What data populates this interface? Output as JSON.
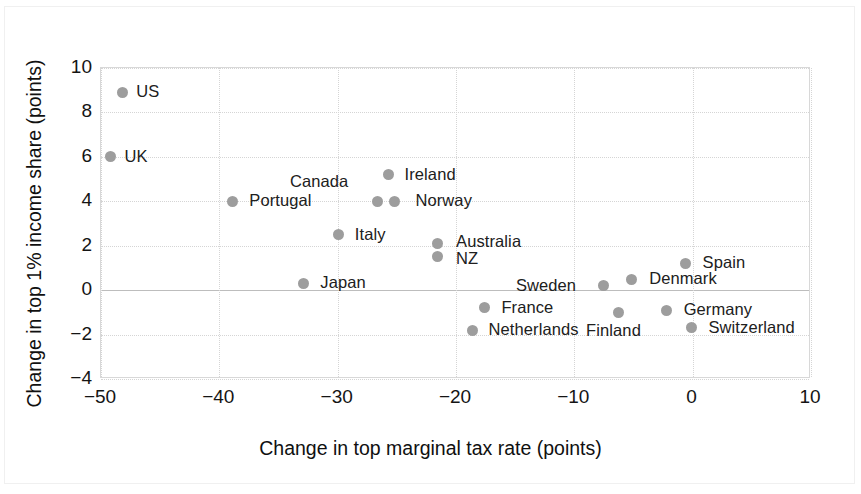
{
  "chart_data": {
    "type": "scatter",
    "title": "",
    "xlabel": "Change in top marginal tax rate (points)",
    "ylabel": "Change in top 1% income share (points)",
    "xlim": [
      -50,
      10
    ],
    "ylim": [
      -4,
      10
    ],
    "xticks": [
      "−50",
      "−40",
      "−30",
      "−20",
      "−10",
      "0",
      "10"
    ],
    "xtick_values": [
      -50,
      -40,
      -30,
      -20,
      -10,
      0,
      10
    ],
    "yticks": [
      "10",
      "8",
      "6",
      "4",
      "2",
      "0",
      "−2",
      "−4"
    ],
    "ytick_values": [
      10,
      8,
      6,
      4,
      2,
      0,
      -2,
      -4
    ],
    "grid": true,
    "legend": "none",
    "marker_color": "#9d9d9d",
    "points": [
      {
        "label": "US",
        "x": -48.2,
        "y": 8.9,
        "lx": 14,
        "ly": -10
      },
      {
        "label": "UK",
        "x": -49.2,
        "y": 6.0,
        "lx": 14,
        "ly": -10
      },
      {
        "label": "Portugal",
        "x": -38.9,
        "y": 4.0,
        "lx": 17,
        "ly": -10
      },
      {
        "label": "Canada",
        "x": -26.6,
        "y": 4.0,
        "lx": -88,
        "ly": -29
      },
      {
        "label": "Ireland",
        "x": -25.7,
        "y": 5.2,
        "lx": 16,
        "ly": -10
      },
      {
        "label": "Norway",
        "x": -25.2,
        "y": 4.0,
        "lx": 21,
        "ly": -10
      },
      {
        "label": "Italy",
        "x": -29.9,
        "y": 2.5,
        "lx": 16,
        "ly": -10
      },
      {
        "label": "Australia",
        "x": -21.6,
        "y": 2.1,
        "lx": 19,
        "ly": -11
      },
      {
        "label": "NZ",
        "x": -21.6,
        "y": 1.5,
        "lx": 19,
        "ly": -8
      },
      {
        "label": "Japan",
        "x": -32.9,
        "y": 0.3,
        "lx": 17,
        "ly": -10
      },
      {
        "label": "Spain",
        "x": -0.6,
        "y": 1.2,
        "lx": 17,
        "ly": -10
      },
      {
        "label": "Denmark",
        "x": -5.2,
        "y": 0.5,
        "lx": 18,
        "ly": -10
      },
      {
        "label": "Sweden",
        "x": -7.5,
        "y": 0.2,
        "lx": -88,
        "ly": -10
      },
      {
        "label": "France",
        "x": -17.6,
        "y": -0.8,
        "lx": 17,
        "ly": -10
      },
      {
        "label": "Finland",
        "x": -6.3,
        "y": -1.0,
        "lx": -32,
        "ly": 9
      },
      {
        "label": "Germany",
        "x": -2.2,
        "y": -0.9,
        "lx": 17,
        "ly": -10
      },
      {
        "label": "Netherlands",
        "x": -18.6,
        "y": -1.8,
        "lx": 16,
        "ly": -10
      },
      {
        "label": "Switzerland",
        "x": -0.1,
        "y": -1.7,
        "lx": 17,
        "ly": -10
      }
    ]
  }
}
